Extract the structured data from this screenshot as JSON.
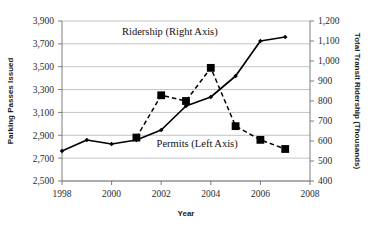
{
  "chart_data": {
    "type": "line",
    "title": "",
    "xlabel": "Year",
    "ylabel": "Parking Passes Issued",
    "y2label": "Total Transit  Ridership (Thousands)",
    "grid": true,
    "legend_position": "inline-annotations",
    "xlim": [
      1998,
      2008
    ],
    "xticks": [
      1998,
      2000,
      2002,
      2004,
      2006,
      2008
    ],
    "xticklabels": [
      "1998",
      "2000",
      "2002",
      "2004",
      "2006",
      "2008"
    ],
    "ylim": [
      2500,
      3900
    ],
    "yticks": [
      2500,
      2700,
      2900,
      3100,
      3300,
      3500,
      3700,
      3900
    ],
    "yticklabels": [
      "2,500",
      "2,700",
      "2,900",
      "3,100",
      "3,300",
      "3,500",
      "3,700",
      "3,900"
    ],
    "y2lim": [
      400,
      1200
    ],
    "y2ticks": [
      400,
      500,
      600,
      700,
      800,
      900,
      1000,
      1100,
      1200
    ],
    "y2ticklabels": [
      "400",
      "500",
      "600",
      "700",
      "800",
      "900",
      "1,000",
      "1,100",
      "1,200"
    ],
    "series": [
      {
        "name": "Ridership (Right Axis)",
        "axis": "right",
        "style": "solid",
        "marker": "diamond",
        "color": "#000000",
        "x": [
          1998,
          1999,
          2000,
          2001,
          2002,
          2003,
          2004,
          2005,
          2006,
          2007
        ],
        "values": [
          550,
          605,
          585,
          605,
          655,
          775,
          820,
          925,
          1100,
          1120
        ]
      },
      {
        "name": "Permits (Left Axis)",
        "axis": "left",
        "style": "dashed",
        "marker": "square",
        "color": "#000000",
        "x": [
          2001,
          2002,
          2003,
          2004,
          2005,
          2006,
          2007
        ],
        "values": [
          2880,
          3250,
          3200,
          3490,
          2980,
          2860,
          2780
        ]
      }
    ],
    "annotations": [
      {
        "text": "Ridership (Right Axis)",
        "x": 2002.35,
        "y_right": 1128
      },
      {
        "text": "Permits (Left Axis)",
        "x": 2003.45,
        "y_left": 2800
      }
    ]
  }
}
